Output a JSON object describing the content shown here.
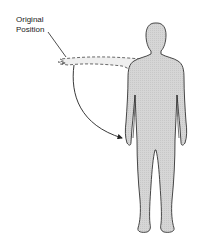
{
  "diagram": {
    "label": {
      "line1": "Original",
      "line2": "Position"
    },
    "colors": {
      "body_fill": "#d9d9d9",
      "outline": "#333333",
      "ghost_fill": "#ececec",
      "background": "#ffffff"
    },
    "elements": {
      "figure": "human-figure-standing",
      "ghost_arm": "arm-original-position-abducted",
      "arrow": "movement-arrow-adduction"
    }
  }
}
